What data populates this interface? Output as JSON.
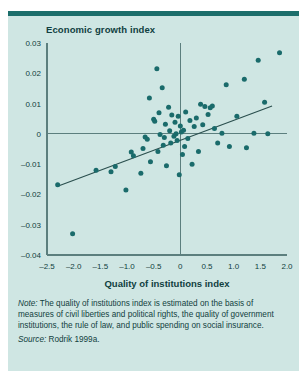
{
  "figure": {
    "title": "Economic growth index",
    "note_label": "Note:",
    "note_text": " The quality of institutions index is estimated on the basis of measures of civil liberties and political rights, the quality of government institutions, the rule of law, and public spending on social insurance.",
    "source_label": "Source:",
    "source_text": " Rodrik 1999a.",
    "colors": {
      "background": "#cfe6e3",
      "rule": "#1c6e6b",
      "point": "#1a6b6b",
      "axis": "#5c7f7e",
      "trend": "#2a4f4e",
      "text": "#103f3e"
    }
  },
  "chart_data": {
    "type": "scatter",
    "title": "Economic growth index",
    "xlabel": "Quality of institutions index",
    "ylabel": "Economic growth index",
    "xlim": [
      -2.5,
      2.0
    ],
    "ylim": [
      -0.04,
      0.03
    ],
    "xticks": [
      -2.5,
      -2.0,
      -1.5,
      -1.0,
      -0.5,
      0,
      0.5,
      1.0,
      1.5,
      2.0
    ],
    "xtick_labels": [
      "–2.5",
      "–2.0",
      "–1.5",
      "–1.0",
      "–0.5",
      "0",
      "0.5",
      "1.0",
      "1.5",
      "2.0"
    ],
    "yticks": [
      0.03,
      0.02,
      0.01,
      0,
      -0.01,
      -0.02,
      -0.03,
      -0.04
    ],
    "ytick_labels": [
      "0.03",
      "0.02",
      "0.01",
      "0",
      "–0.01",
      "–0.02",
      "–0.03",
      "–0.04"
    ],
    "grid": false,
    "legend": null,
    "zero_lines": {
      "x": 0,
      "y": 0
    },
    "trend_line": {
      "type": "linear-fit",
      "x_start": -2.3,
      "y_start": -0.0173,
      "x_end": 1.72,
      "y_end": 0.0092
    },
    "points": [
      [
        -2.3,
        -0.0168
      ],
      [
        -2.02,
        -0.033
      ],
      [
        -1.58,
        -0.012
      ],
      [
        -1.3,
        -0.0125
      ],
      [
        -1.22,
        -0.0108
      ],
      [
        -1.02,
        -0.0185
      ],
      [
        -0.92,
        -0.006
      ],
      [
        -0.88,
        -0.0072
      ],
      [
        -0.74,
        -0.013
      ],
      [
        -0.7,
        -0.0048
      ],
      [
        -0.66,
        -0.001
      ],
      [
        -0.62,
        -0.0018
      ],
      [
        -0.58,
        0.0118
      ],
      [
        -0.56,
        -0.0092
      ],
      [
        -0.5,
        0.0048
      ],
      [
        -0.48,
        0.0042
      ],
      [
        -0.44,
        0.0215
      ],
      [
        -0.42,
        -0.0058
      ],
      [
        -0.4,
        0.007
      ],
      [
        -0.38,
        -0.0002
      ],
      [
        -0.34,
        0.0152
      ],
      [
        -0.32,
        -0.0038
      ],
      [
        -0.3,
        -0.0012
      ],
      [
        -0.28,
        0.0032
      ],
      [
        -0.26,
        -0.0105
      ],
      [
        -0.22,
        0.0088
      ],
      [
        -0.2,
        0.001
      ],
      [
        -0.18,
        -0.003
      ],
      [
        -0.16,
        0.0062
      ],
      [
        -0.12,
        -0.0008
      ],
      [
        -0.1,
        0.0038
      ],
      [
        -0.08,
        0.0
      ],
      [
        -0.06,
        -0.0022
      ],
      [
        -0.04,
        0.0058
      ],
      [
        -0.02,
        -0.0135
      ],
      [
        0.0,
        0.0026
      ],
      [
        0.02,
        0.0006
      ],
      [
        0.04,
        -0.0068
      ],
      [
        0.06,
        0.0012
      ],
      [
        0.08,
        -0.0042
      ],
      [
        0.1,
        0.0072
      ],
      [
        0.14,
        -0.0015
      ],
      [
        0.18,
        0.0044
      ],
      [
        0.22,
        -0.01
      ],
      [
        0.26,
        0.0024
      ],
      [
        0.3,
        0.0052
      ],
      [
        0.34,
        -0.0058
      ],
      [
        0.38,
        0.0098
      ],
      [
        0.42,
        0.003
      ],
      [
        0.46,
        0.009
      ],
      [
        0.52,
        0.0064
      ],
      [
        0.56,
        0.0086
      ],
      [
        0.6,
        0.0092
      ],
      [
        0.64,
        0.0018
      ],
      [
        0.7,
        -0.003
      ],
      [
        0.78,
        0.0002
      ],
      [
        0.86,
        0.0162
      ],
      [
        0.92,
        -0.0042
      ],
      [
        1.06,
        0.0058
      ],
      [
        1.2,
        0.018
      ],
      [
        1.24,
        -0.0046
      ],
      [
        1.38,
        0.0002
      ],
      [
        1.46,
        0.0243
      ],
      [
        1.58,
        0.0104
      ],
      [
        1.64,
        0.0
      ],
      [
        1.86,
        0.0268
      ]
    ]
  }
}
